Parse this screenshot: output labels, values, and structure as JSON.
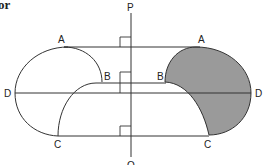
{
  "figure": {
    "caption_fragment": "or",
    "axis_labels": {
      "top": "P",
      "bottom": "Q"
    },
    "left_shape": {
      "labels": {
        "top": "A",
        "inner": "B",
        "left": "D",
        "bottom": "C"
      },
      "shaded": false
    },
    "right_shape": {
      "labels": {
        "top": "A",
        "inner": "B",
        "right": "D",
        "bottom": "C"
      },
      "shaded": true
    },
    "colors": {
      "line": "#333333",
      "shade": "#9a9a9a",
      "background": "#ffffff"
    },
    "right_angle_marks": 3
  }
}
